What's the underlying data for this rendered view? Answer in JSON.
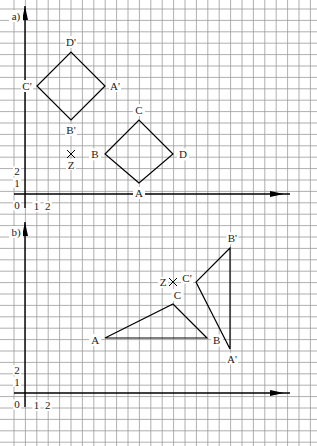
{
  "diagram": {
    "grid": {
      "spacing": 11.4,
      "x0": 2.6,
      "color": "#9a9a9a"
    },
    "panels": [
      {
        "label": "a)",
        "axis_origin": [
          25,
          194
        ],
        "y_axis_top": 6,
        "ticks_x": [
          "1",
          "2"
        ],
        "ticks_y": [
          "0",
          "1",
          "2"
        ],
        "shapes": [
          {
            "name": "square-ABCD",
            "points": [
              [
                139,
                183
              ],
              [
                105,
                154
              ],
              [
                139,
                120
              ],
              [
                173,
                154
              ]
            ],
            "labels": [
              "A",
              "B",
              "C",
              "D"
            ]
          },
          {
            "name": "square-A'B'C'D'",
            "points": [
              [
                105,
                86
              ],
              [
                71,
                120
              ],
              [
                37,
                86
              ],
              [
                71,
                52
              ]
            ],
            "labels": [
              "A'",
              "B'",
              "C'",
              "D'"
            ]
          }
        ],
        "center": {
          "label": "Z",
          "point": [
            71,
            154
          ]
        }
      },
      {
        "label": "b)",
        "axis_origin": [
          25,
          393
        ],
        "y_axis_top": 222,
        "ticks_x": [
          "1",
          "2"
        ],
        "ticks_y": [
          "0",
          "1",
          "2"
        ],
        "shapes": [
          {
            "name": "triangle-ABC",
            "points": [
              [
                105,
                338
              ],
              [
                207,
                338
              ],
              [
                173,
                304
              ]
            ],
            "labels": [
              "A",
              "B",
              "C"
            ]
          },
          {
            "name": "triangle-A'B'C'",
            "points": [
              [
                230,
                349
              ],
              [
                230,
                248
              ],
              [
                196,
                282
              ]
            ],
            "labels": [
              "A'",
              "B'",
              "C'"
            ]
          }
        ],
        "center": {
          "label": "Z",
          "point": [
            173,
            282
          ]
        }
      }
    ]
  }
}
